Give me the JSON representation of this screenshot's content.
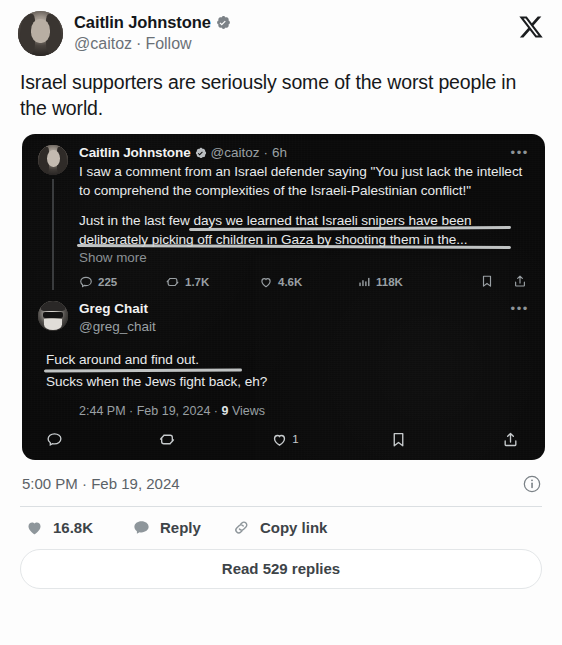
{
  "header": {
    "display_name": "Caitlin Johnstone",
    "verified": true,
    "handle": "@caitoz",
    "separator": "·",
    "follow_label": "Follow",
    "logo": "x-logo"
  },
  "main_tweet": {
    "text": "Israel supporters are seriously some of the worst people in the world.",
    "timestamp": "5:00 PM · Feb 19, 2024"
  },
  "quoted_thread": {
    "tweet1": {
      "display_name": "Caitlin Johnstone",
      "verified": true,
      "handle": "@caitoz",
      "separator": "·",
      "time": "6h",
      "more_label": "•••",
      "paragraph1": "I saw a comment from an Israel defender saying \"You just lack the intellect to comprehend the complexities of the Israeli-Palestinian conflict!\"",
      "paragraph2": "Just in the last few days we learned that Israeli snipers have been deliberately picking off children in Gaza by shooting them in the...",
      "show_more": "Show more",
      "metrics": {
        "replies": "225",
        "retweets": "1.7K",
        "likes": "4.6K",
        "views": "118K"
      }
    },
    "tweet2": {
      "display_name": "Greg Chait",
      "handle": "@greg_chait",
      "more_label": "•••",
      "line1": "Fuck around and find out.",
      "line2": "Sucks when the Jews fight back, eh?",
      "timestamp_time": "2:44 PM",
      "timestamp_date": "Feb 19, 2024",
      "views_count": "9",
      "views_label": "Views",
      "actions": {
        "reply_count": "",
        "retweet_count": "",
        "like_count": "1",
        "bookmark_count": "",
        "share_count": ""
      }
    }
  },
  "footer": {
    "likes_count": "16.8K",
    "reply_label": "Reply",
    "copy_link_label": "Copy link",
    "read_replies_label": "Read 529 replies"
  },
  "colors": {
    "page_background": "#fdfdfd",
    "card_background": "#0b0b0b",
    "primary_text": "#16181a",
    "muted_text": "#6b7177",
    "dark_card_text": "#e8eaeb",
    "dark_muted_text": "#9aa0a4",
    "divider": "#dbdfe2"
  }
}
